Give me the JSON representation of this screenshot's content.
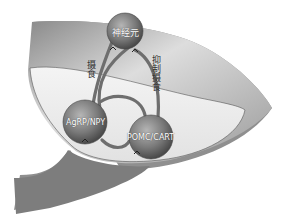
{
  "diagram": {
    "nodes": {
      "top": {
        "label": "神经元"
      },
      "left": {
        "label": "AgRP/NPY"
      },
      "right": {
        "label": "POMC/CART"
      }
    },
    "edges": {
      "left_label": "摄食",
      "right_label": "抑制摄食"
    },
    "colors": {
      "neuron_fill": "#7a7a7a",
      "tissue_light": "#eeeeee",
      "tissue_dark": "#9a9a9a",
      "axon": "#6e6e6e"
    }
  }
}
